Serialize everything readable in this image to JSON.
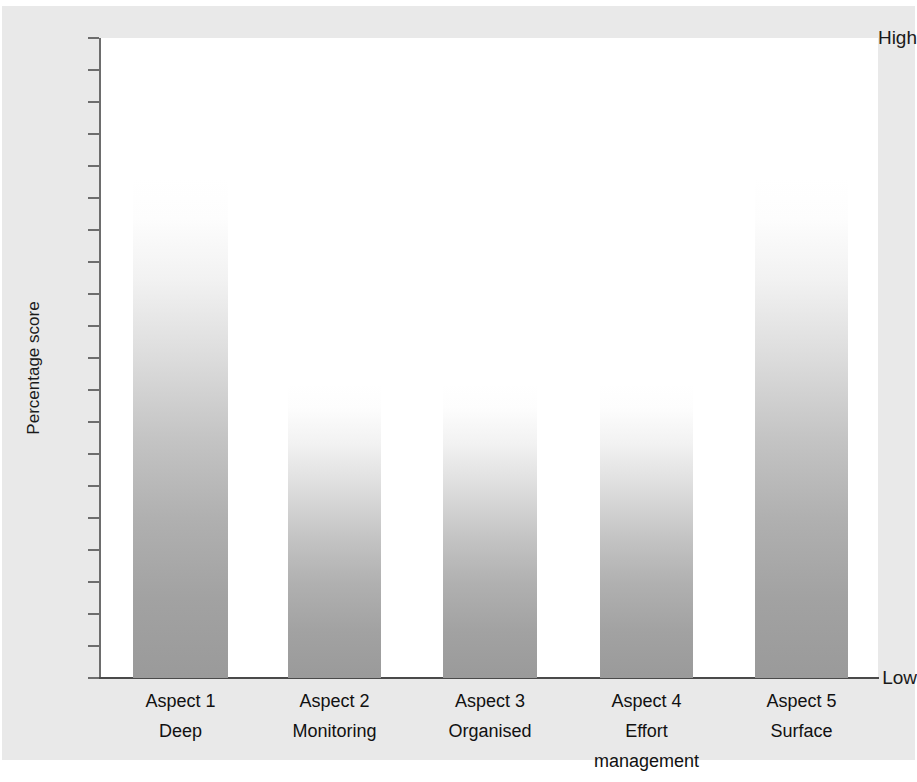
{
  "chart_data": {
    "type": "bar",
    "title": "",
    "xlabel": "",
    "ylabel": "Percentage score",
    "categories": [
      "Aspect 1",
      "Aspect 2",
      "Aspect 3",
      "Aspect 4",
      "Aspect 5"
    ],
    "category_sublabels": [
      "Deep",
      "Monitoring",
      "Organised",
      "Effort management",
      "Surface"
    ],
    "values": [
      78,
      46,
      46,
      46,
      78
    ],
    "ylim": [
      0,
      100
    ],
    "y_tick_labels": [
      "Low",
      "High"
    ],
    "y_tick_count": 21,
    "grid": false,
    "legend": false,
    "bar_fill": "vertical gradient white to grey",
    "bar_color_top": "#ffffff",
    "bar_color_bottom": "#9a9a9a"
  },
  "axes": {
    "y_high_label": "High",
    "y_low_label": "Low",
    "y_title": "Percentage score"
  },
  "bars": [
    {
      "name": "Aspect 1",
      "sub": "Deep",
      "left": 133,
      "width": 95,
      "top": 178,
      "value": 78
    },
    {
      "name": "Aspect 2",
      "sub": "Monitoring",
      "left": 288,
      "width": 93,
      "top": 384,
      "value": 46
    },
    {
      "name": "Aspect 3",
      "sub": "Organised",
      "left": 443,
      "width": 94,
      "top": 384,
      "value": 46
    },
    {
      "name": "Aspect 4",
      "sub": "Effort management",
      "left": 600,
      "width": 93,
      "top": 384,
      "value": 46
    },
    {
      "name": "Aspect 5",
      "sub": "Surface",
      "left": 755,
      "width": 93,
      "top": 178,
      "value": 78
    }
  ],
  "x_labels": [
    {
      "line1": "Aspect 1",
      "line2": "Deep"
    },
    {
      "line1": "Aspect 2",
      "line2": "Monitoring"
    },
    {
      "line1": "Aspect 3",
      "line2": "Organised"
    },
    {
      "line1": "Aspect 4",
      "line2": "Effort",
      "line3": "management"
    },
    {
      "line1": "Aspect 5",
      "line2": "Surface"
    }
  ],
  "colors": {
    "figure_background": "#ffffff",
    "panel_background": "#e9e9e9",
    "plot_background": "#ffffff",
    "axis": "#4a4a4a",
    "tick": "#6d6d6d",
    "text": "#111111"
  }
}
